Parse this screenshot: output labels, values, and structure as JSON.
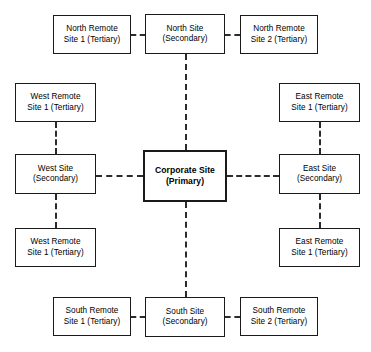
{
  "diagram": {
    "background_color": "#ffffff",
    "line_color": "#2b2b2b",
    "border_color": "#1a1a1a",
    "nodes": {
      "corporate": {
        "line1": "Corporate Site",
        "line2": "(Primary)",
        "tier": "Primary"
      },
      "north_site": {
        "line1": "North Site",
        "line2": "(Secondary)",
        "tier": "Secondary"
      },
      "south_site": {
        "line1": "South Site",
        "line2": "(Secondary)",
        "tier": "Secondary"
      },
      "east_site": {
        "line1": "East Site",
        "line2": "(Secondary)",
        "tier": "Secondary"
      },
      "west_site": {
        "line1": "West Site",
        "line2": "(Secondary)",
        "tier": "Secondary"
      },
      "north_remote_1": {
        "line1": "North Remote",
        "line2": "Site 1 (Tertiary)",
        "tier": "Tertiary"
      },
      "north_remote_2": {
        "line1": "North Remote",
        "line2": "Site 2 (Tertiary)",
        "tier": "Tertiary"
      },
      "south_remote_1": {
        "line1": "South Remote",
        "line2": "Site 1 (Tertiary)",
        "tier": "Tertiary"
      },
      "south_remote_2": {
        "line1": "South Remote",
        "line2": "Site 2 (Tertiary)",
        "tier": "Tertiary"
      },
      "east_remote_top": {
        "line1": "East Remote",
        "line2": "Site 1 (Tertiary)",
        "tier": "Tertiary"
      },
      "east_remote_bottom": {
        "line1": "East Remote",
        "line2": "Site 1 (Tertiary)",
        "tier": "Tertiary"
      },
      "west_remote_top": {
        "line1": "West Remote",
        "line2": "Site 1 (Tertiary)",
        "tier": "Tertiary"
      },
      "west_remote_bottom": {
        "line1": "West Remote",
        "line2": "Site 1 (Tertiary)",
        "tier": "Tertiary"
      }
    }
  }
}
